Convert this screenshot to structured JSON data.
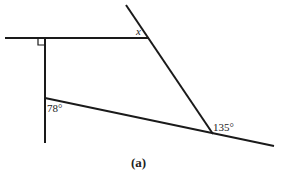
{
  "figure": {
    "caption": "(a)",
    "line_color": "#1a1a1a",
    "label_color": "#222222",
    "lines": {
      "top_horizontal": {
        "x1": 5,
        "y1": 38,
        "x2": 149,
        "y2": 38
      },
      "vertical": {
        "x1": 45,
        "y1": 38,
        "x2": 45,
        "y2": 143
      },
      "transversal": {
        "x1": 126,
        "y1": 5,
        "x2": 213,
        "y2": 134
      },
      "bottom_slanted": {
        "x1": 45,
        "y1": 98,
        "x2": 274,
        "y2": 146
      }
    },
    "right_angle_marker": {
      "x": 38,
      "y": 38,
      "size": 7
    },
    "labels": {
      "x": {
        "text": "x",
        "x": 136,
        "y": 35
      },
      "angle_78": {
        "text": "78°",
        "x": 47,
        "y": 112
      },
      "angle_135": {
        "text": "135°",
        "x": 213,
        "y": 131
      },
      "caption": {
        "text": "(a)",
        "x": 131,
        "y": 167
      }
    }
  }
}
